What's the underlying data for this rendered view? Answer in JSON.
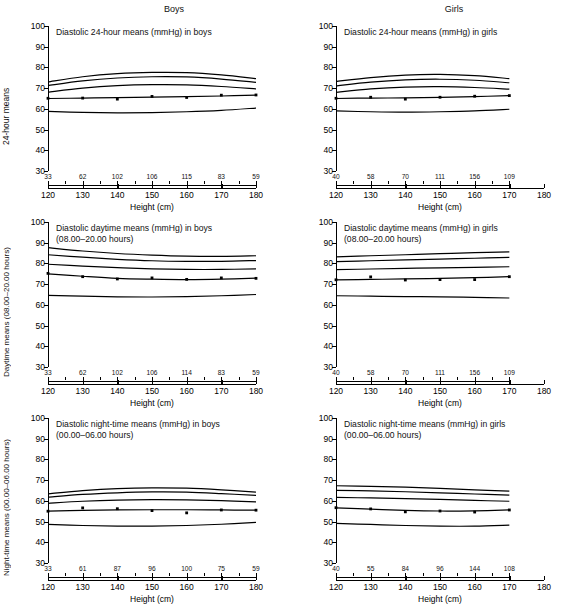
{
  "figure": {
    "column_headers": [
      "Boys",
      "Girls"
    ],
    "xlabel": "Height (cm)",
    "y_axis_labels": [
      "24-hour means",
      "Daytime means (08.00–20.00 hours)",
      "Night-time means (00.00–06.00 hours)"
    ],
    "y_ticks": [
      "100",
      "90",
      "80",
      "70",
      "60",
      "50",
      "40",
      "30"
    ],
    "x_ticks": [
      "120",
      "130",
      "140",
      "150",
      "160",
      "170",
      "180"
    ]
  },
  "chart_data": [
    {
      "id": "diastolic-24h-boys",
      "type": "line",
      "title": "Diastolic 24-hour means (mmHg) in boys",
      "subtitle": "",
      "xlabel": "Height (cm)",
      "ylabel": "24-hour means",
      "xlim": [
        120,
        180
      ],
      "ylim": [
        30,
        100
      ],
      "grid": false,
      "legend": "none",
      "x": [
        120,
        130,
        140,
        150,
        160,
        170,
        180
      ],
      "n_counts": [
        33,
        62,
        102,
        106,
        115,
        83,
        59
      ],
      "series": [
        {
          "name": "95th centile",
          "values": [
            73.0,
            75.5,
            77.0,
            77.6,
            77.5,
            76.4,
            74.6
          ]
        },
        {
          "name": "90th centile",
          "values": [
            71.3,
            73.5,
            74.9,
            75.5,
            75.4,
            74.4,
            72.8
          ]
        },
        {
          "name": "75th centile",
          "values": [
            68.1,
            70.0,
            71.2,
            71.7,
            71.6,
            70.8,
            69.6
          ]
        },
        {
          "name": "50th centile",
          "values": [
            65.0,
            65.2,
            65.4,
            65.7,
            65.9,
            66.2,
            66.6
          ]
        },
        {
          "name": "5th centile",
          "values": [
            58.8,
            58.3,
            58.1,
            58.2,
            58.6,
            59.3,
            60.4
          ]
        }
      ],
      "points": {
        "x": [
          120,
          130,
          140,
          150,
          160,
          170,
          180
        ],
        "y": [
          65.1,
          65.2,
          64.7,
          66.0,
          65.5,
          66.6,
          66.7
        ]
      }
    },
    {
      "id": "diastolic-24h-girls",
      "type": "line",
      "title": "Diastolic 24-hour means (mmHg) in girls",
      "subtitle": "",
      "xlabel": "Height (cm)",
      "ylabel": "24-hour means",
      "xlim": [
        120,
        180
      ],
      "ylim": [
        30,
        100
      ],
      "grid": false,
      "legend": "none",
      "x": [
        120,
        130,
        140,
        150,
        160,
        170
      ],
      "n_counts": [
        40,
        58,
        70,
        111,
        156,
        109
      ],
      "series": [
        {
          "name": "95th centile",
          "values": [
            73.2,
            75.1,
            76.3,
            76.6,
            76.0,
            74.6
          ]
        },
        {
          "name": "90th centile",
          "values": [
            71.1,
            72.9,
            74.0,
            74.3,
            73.8,
            72.6
          ]
        },
        {
          "name": "75th centile",
          "values": [
            68.0,
            69.6,
            70.5,
            70.7,
            70.3,
            69.5
          ]
        },
        {
          "name": "50th centile",
          "values": [
            65.0,
            65.2,
            65.3,
            65.5,
            65.9,
            66.4
          ]
        },
        {
          "name": "5th centile",
          "values": [
            59.0,
            58.6,
            58.4,
            58.6,
            59.0,
            59.8
          ]
        }
      ],
      "points": {
        "x": [
          120,
          130,
          140,
          150,
          160,
          170
        ],
        "y": [
          65.1,
          65.6,
          64.7,
          65.6,
          66.1,
          66.4
        ]
      }
    },
    {
      "id": "diastolic-daytime-boys",
      "type": "line",
      "title": "Diastolic daytime means (mmHg) in boys",
      "subtitle": "(08.00–20.00 hours)",
      "xlabel": "Height (cm)",
      "ylabel": "Daytime means (08.00–20.00 hours)",
      "xlim": [
        120,
        180
      ],
      "ylim": [
        30,
        100
      ],
      "grid": false,
      "legend": "none",
      "x": [
        120,
        130,
        140,
        150,
        160,
        170,
        180
      ],
      "n_counts": [
        33,
        62,
        102,
        106,
        114,
        83,
        59
      ],
      "series": [
        {
          "name": "95th centile",
          "values": [
            87.6,
            86.0,
            84.8,
            84.0,
            83.5,
            83.4,
            83.7
          ]
        },
        {
          "name": "90th centile",
          "values": [
            84.2,
            83.0,
            82.0,
            81.3,
            81.0,
            81.0,
            81.4
          ]
        },
        {
          "name": "75th centile",
          "values": [
            79.6,
            78.7,
            78.0,
            77.4,
            77.1,
            77.1,
            77.4
          ]
        },
        {
          "name": "50th centile",
          "values": [
            75.0,
            73.8,
            72.8,
            72.4,
            72.2,
            72.4,
            72.9
          ]
        },
        {
          "name": "5th centile",
          "values": [
            64.6,
            64.2,
            63.9,
            63.8,
            64.0,
            64.4,
            65.0
          ]
        }
      ],
      "points": {
        "x": [
          120,
          130,
          140,
          150,
          160,
          170,
          180
        ],
        "y": [
          75.2,
          73.6,
          72.5,
          73.0,
          72.3,
          73.0,
          72.8
        ]
      }
    },
    {
      "id": "diastolic-daytime-girls",
      "type": "line",
      "title": "Diastolic daytime means (mmHg) in girls",
      "subtitle": "(08.00–20.00 hours)",
      "xlabel": "Height (cm)",
      "ylabel": "Daytime means (08.00–20.00 hours)",
      "xlim": [
        120,
        180
      ],
      "ylim": [
        30,
        100
      ],
      "grid": false,
      "legend": "none",
      "x": [
        120,
        130,
        140,
        150,
        160,
        170
      ],
      "n_counts": [
        40,
        58,
        70,
        111,
        156,
        109
      ],
      "series": [
        {
          "name": "95th centile",
          "values": [
            83.2,
            83.7,
            84.2,
            84.7,
            85.2,
            85.6
          ]
        },
        {
          "name": "90th centile",
          "values": [
            80.9,
            81.3,
            81.7,
            82.1,
            82.5,
            82.9
          ]
        },
        {
          "name": "75th centile",
          "values": [
            77.0,
            77.3,
            77.6,
            77.9,
            78.1,
            78.4
          ]
        },
        {
          "name": "50th centile",
          "values": [
            72.1,
            72.3,
            72.5,
            72.8,
            73.1,
            73.6
          ]
        },
        {
          "name": "5th centile",
          "values": [
            64.4,
            64.2,
            64.0,
            63.9,
            63.6,
            63.3
          ]
        }
      ],
      "points": {
        "x": [
          120,
          130,
          140,
          150,
          160,
          170
        ],
        "y": [
          72.1,
          73.5,
          72.0,
          72.2,
          72.2,
          73.6
        ]
      }
    },
    {
      "id": "diastolic-nighttime-boys",
      "type": "line",
      "title": "Diastolic night-time means (mmHg) in boys",
      "subtitle": "(00.00–06.00 hours)",
      "xlabel": "Height (cm)",
      "ylabel": "Night-time means (00.00–06.00 hours)",
      "xlim": [
        120,
        180
      ],
      "ylim": [
        30,
        100
      ],
      "grid": false,
      "legend": "none",
      "x": [
        120,
        130,
        140,
        150,
        160,
        170,
        180
      ],
      "n_counts": [
        33,
        61,
        87,
        96,
        100,
        75,
        59
      ],
      "series": [
        {
          "name": "95th centile",
          "values": [
            63.4,
            64.9,
            65.9,
            66.3,
            66.1,
            65.3,
            64.2
          ]
        },
        {
          "name": "90th centile",
          "values": [
            61.8,
            63.1,
            63.9,
            64.3,
            64.2,
            63.5,
            62.6
          ]
        },
        {
          "name": "75th centile",
          "values": [
            58.8,
            59.8,
            60.4,
            60.6,
            60.5,
            60.1,
            59.5
          ]
        },
        {
          "name": "50th centile",
          "values": [
            55.0,
            55.4,
            55.6,
            55.7,
            55.7,
            55.6,
            55.5
          ]
        },
        {
          "name": "5th centile",
          "values": [
            48.6,
            48.1,
            47.8,
            47.8,
            48.1,
            48.7,
            49.6
          ]
        }
      ],
      "points": {
        "x": [
          120,
          130,
          140,
          150,
          160,
          170,
          180
        ],
        "y": [
          55.0,
          56.6,
          56.2,
          55.3,
          54.2,
          55.6,
          55.5
        ]
      }
    },
    {
      "id": "diastolic-nighttime-girls",
      "type": "line",
      "title": "Diastolic night-time means (mmHg) in girls",
      "subtitle": "(00.00–06.00 hours)",
      "xlabel": "Height (cm)",
      "ylabel": "Night-time means (00.00–06.00 hours)",
      "xlim": [
        120,
        180
      ],
      "ylim": [
        30,
        100
      ],
      "grid": false,
      "legend": "none",
      "x": [
        120,
        130,
        140,
        150,
        160,
        170
      ],
      "n_counts": [
        40,
        55,
        84,
        96,
        144,
        108
      ],
      "series": [
        {
          "name": "95th centile",
          "values": [
            67.3,
            67.0,
            66.6,
            66.0,
            65.3,
            64.7
          ]
        },
        {
          "name": "90th centile",
          "values": [
            65.1,
            64.8,
            64.4,
            63.9,
            63.3,
            62.8
          ]
        },
        {
          "name": "75th centile",
          "values": [
            61.7,
            61.4,
            61.1,
            60.7,
            60.2,
            59.8
          ]
        },
        {
          "name": "50th centile",
          "values": [
            56.6,
            56.0,
            55.4,
            55.1,
            55.2,
            55.6
          ]
        },
        {
          "name": "5th centile",
          "values": [
            49.1,
            48.6,
            48.1,
            47.8,
            47.8,
            48.3
          ]
        }
      ],
      "points": {
        "x": [
          120,
          130,
          140,
          150,
          160,
          170
        ],
        "y": [
          56.7,
          56.1,
          54.7,
          55.1,
          54.6,
          55.6
        ]
      }
    }
  ]
}
